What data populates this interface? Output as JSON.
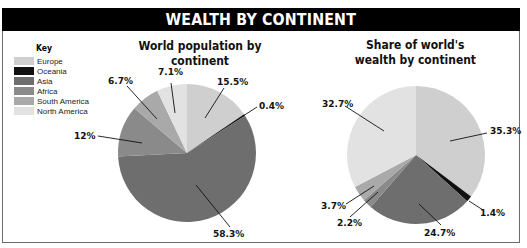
{
  "title": "WEALTH BY CONTINENT",
  "legend": {
    "title": "Key",
    "items": [
      {
        "label": "Europe",
        "color": "#cfcfcf"
      },
      {
        "label": "Oceania",
        "color": "#111111"
      },
      {
        "label": "Asia",
        "color": "#6e6e6e"
      },
      {
        "label": "Africa",
        "color": "#8a8a8a"
      },
      {
        "label": "South America",
        "color": "#a9a9a9"
      },
      {
        "label": "North America",
        "color": "#e2e2e2"
      }
    ]
  },
  "chart_data": [
    {
      "type": "pie",
      "title": "World population by continent",
      "categories": [
        "Europe",
        "Oceania",
        "Asia",
        "Africa",
        "South America",
        "North America"
      ],
      "values": [
        15.5,
        0.4,
        58.3,
        12,
        6.7,
        7.1
      ],
      "labels": [
        "15.5%",
        "0.4%",
        "58.3%",
        "12%",
        "6.7%",
        "7.1%"
      ],
      "start_angle": "12 o'clock",
      "direction": "clockwise",
      "legend_position": "top-left"
    },
    {
      "type": "pie",
      "title": "Share of world's wealth by continent",
      "categories": [
        "Europe",
        "Oceania",
        "Asia",
        "Africa",
        "South America",
        "North America"
      ],
      "values": [
        35.3,
        1.4,
        24.7,
        2.2,
        3.7,
        32.7
      ],
      "labels": [
        "35.3%",
        "1.4%",
        "24.7%",
        "2.2%",
        "3.7%",
        "32.7%"
      ],
      "start_angle": "12 o'clock",
      "direction": "clockwise",
      "legend_position": "top-left"
    }
  ],
  "charts": {
    "population": {
      "title": "World population by continent",
      "labels": {
        "europe": "15.5%",
        "oceania": "0.4%",
        "asia": "58.3%",
        "africa": "12%",
        "south_america": "6.7%",
        "north_america": "7.1%"
      }
    },
    "wealth": {
      "title_line1": "Share of world's",
      "title_line2": "wealth by continent",
      "labels": {
        "europe": "35.3%",
        "oceania": "1.4%",
        "asia": "24.7%",
        "africa": "2.2%",
        "south_america": "3.7%",
        "north_america": "32.7%"
      }
    }
  }
}
